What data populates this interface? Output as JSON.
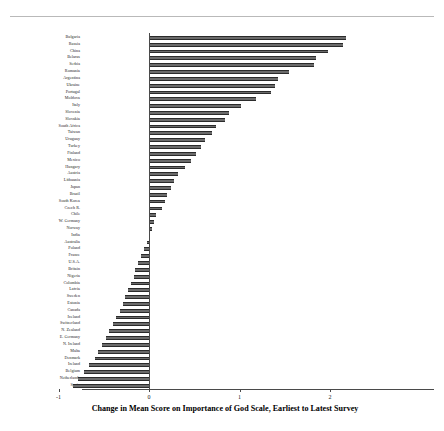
{
  "chart_data": {
    "type": "bar",
    "orientation": "horizontal",
    "title": "Change in Mean Score on Importance of God Scale, Earliest to Latest Survey",
    "xlabel": "",
    "ylabel": "",
    "xlim": [
      -2,
      2
    ],
    "xticks": [
      -2,
      -1,
      0,
      1,
      2
    ],
    "xticklabels": [
      "-2",
      "-1",
      "0",
      "1",
      "2"
    ],
    "grid": false,
    "legend": null,
    "bar_color": "#6b6b6b",
    "bar_edge_color": "#2b2b2b",
    "categories": [
      "Bulgaria",
      "Russia",
      "China",
      "Belarus",
      "Serbia",
      "Romania",
      "Argentina",
      "Ukraine",
      "Portugal",
      "Moldova",
      "Italy",
      "Slovenia",
      "Slovakia",
      "South Africa",
      "Taiwan",
      "Uruguay",
      "Turkey",
      "Finland",
      "Mexico",
      "Hungary",
      "Austria",
      "Lithuania",
      "Japan",
      "Brazil",
      "South Korea",
      "Czech R.",
      "Chile",
      "W. Germany",
      "Norway",
      "India",
      "Australia",
      "Poland",
      "France",
      "U.S.A.",
      "Britain",
      "Nigeria",
      "Colombia",
      "Latvia",
      "Sweden",
      "Estonia",
      "Canada",
      "Iceland",
      "Switzerland",
      "N. Zealand",
      "E. Germany",
      "N. Ireland",
      "Malta",
      "Denmark",
      "Ireland",
      "Belgium",
      "Netherlands",
      "Spain"
    ],
    "values": [
      2.18,
      2.14,
      1.98,
      1.85,
      1.82,
      1.55,
      1.42,
      1.39,
      1.35,
      1.18,
      1.02,
      0.88,
      0.84,
      0.74,
      0.7,
      0.62,
      0.58,
      0.52,
      0.46,
      0.4,
      0.32,
      0.28,
      0.24,
      0.2,
      0.18,
      0.14,
      0.08,
      0.06,
      0.03,
      0.01,
      -0.02,
      -0.06,
      -0.09,
      -0.12,
      -0.15,
      -0.17,
      -0.2,
      -0.23,
      -0.26,
      -0.29,
      -0.32,
      -0.36,
      -0.4,
      -0.44,
      -0.48,
      -0.52,
      -0.56,
      -0.6,
      -0.66,
      -0.72,
      -0.78,
      -0.84
    ]
  }
}
